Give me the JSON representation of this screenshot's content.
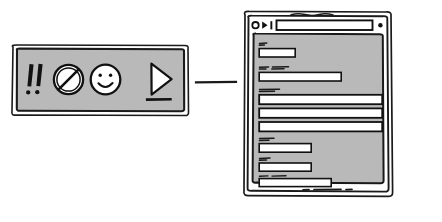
{
  "scene": {
    "title": "Hand-drawn wireframe: icon toolbar linked to browser form window",
    "background_color": "#ffffff",
    "ink_color": "#1a1a1a",
    "panel_fill": "#b9b9b9",
    "field_fill": "#ffffff",
    "width": 442,
    "height": 222
  },
  "toolbar": {
    "name": "icon-toolbar-panel",
    "fill": "#b9b9b9",
    "stroke": "#1a1a1a",
    "x": 10,
    "y": 44,
    "width": 180,
    "height": 72,
    "items": [
      {
        "icon": "double-exclamation-icon",
        "label": "!!"
      },
      {
        "icon": "prohibited-icon",
        "label": "no"
      },
      {
        "icon": "smiley-face-icon",
        "label": ":)"
      },
      {
        "icon": "play-triangle-icon",
        "label": "play"
      }
    ]
  },
  "connector": {
    "name": "connector-line",
    "x1": 196,
    "y1": 82,
    "x2": 236,
    "y2": 82,
    "color": "#1a1a1a"
  },
  "browser": {
    "name": "browser-window-sketch",
    "x": 241,
    "y": 10,
    "width": 152,
    "height": 188,
    "fill": "#b9b9b9",
    "titlebar": {
      "name": "browser-titlebar",
      "title_squiggle": "~~~~~~",
      "nav_icons": [
        {
          "icon": "back-circle-icon",
          "label": "back"
        },
        {
          "icon": "forward-triangle-icon",
          "label": "forward"
        },
        {
          "icon": "stop-bar-icon",
          "label": "stop"
        }
      ],
      "url_field": {
        "name": "url-input",
        "value": "",
        "placeholder": ""
      },
      "right_dot": {
        "icon": "menu-dot-icon",
        "label": "menu"
      }
    },
    "form": {
      "name": "form-content-area",
      "rows": [
        {
          "label_squiggle": "~~",
          "field": {
            "name": "form-field-1",
            "width": 36,
            "value": ""
          }
        },
        {
          "label_squiggle": "~~~ ~~~~~",
          "field": {
            "name": "form-field-2",
            "width": 82,
            "value": ""
          }
        },
        {
          "label_squiggle": "~~~~~~",
          "field": {
            "name": "form-field-3",
            "width": 123,
            "value": ""
          }
        },
        {
          "label_squiggle": "",
          "field": {
            "name": "form-field-4",
            "width": 123,
            "value": ""
          }
        },
        {
          "label_squiggle": "",
          "field": {
            "name": "form-field-5",
            "width": 123,
            "value": ""
          }
        },
        {
          "label_squiggle": "~~~~",
          "field": {
            "name": "form-field-6",
            "width": 52,
            "value": ""
          }
        },
        {
          "label_squiggle": "~~~",
          "field": {
            "name": "form-field-7",
            "width": 52,
            "value": ""
          }
        },
        {
          "label_squiggle": "~~~ ~~~~",
          "field": {
            "name": "form-field-8",
            "width": 72,
            "value": ""
          }
        }
      ],
      "footer_squiggle": "~~  ~~~~~~~~  ~~"
    }
  }
}
